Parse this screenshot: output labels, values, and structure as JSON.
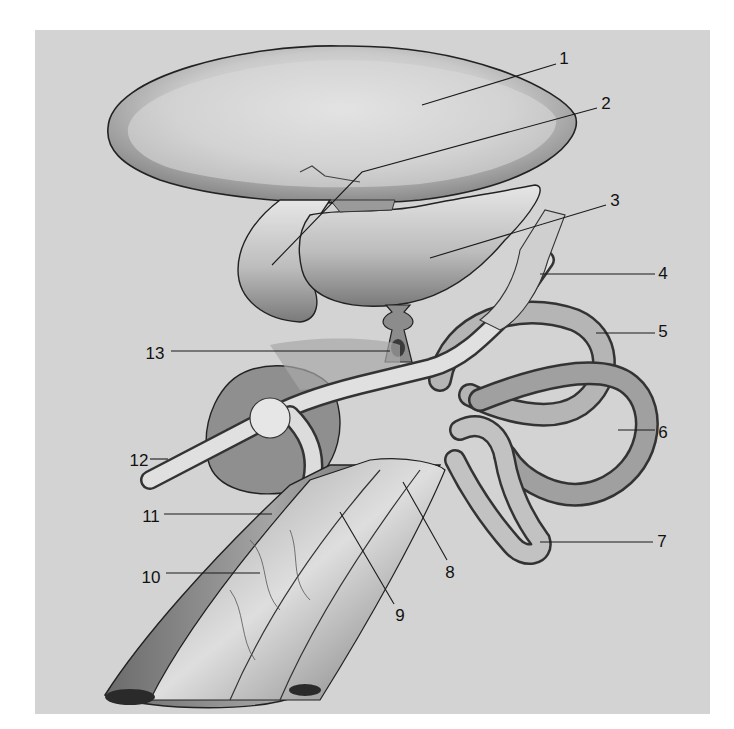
{
  "figure": {
    "background_color": "#d3d3d3",
    "line_color": "#1a1a1a",
    "labels": [
      {
        "id": 1,
        "text": "1",
        "x": 564,
        "y": 58,
        "leader": [
          [
            422,
            105
          ],
          [
            556,
            64
          ]
        ]
      },
      {
        "id": 2,
        "text": "2",
        "x": 606,
        "y": 103,
        "leader": [
          [
            272,
            265
          ],
          [
            362,
            172
          ],
          [
            597,
            108
          ]
        ]
      },
      {
        "id": 3,
        "text": "3",
        "x": 615,
        "y": 200,
        "leader": [
          [
            430,
            258
          ],
          [
            606,
            205
          ]
        ]
      },
      {
        "id": 4,
        "text": "4",
        "x": 663,
        "y": 273,
        "leader": [
          [
            540,
            274
          ],
          [
            655,
            274
          ]
        ]
      },
      {
        "id": 5,
        "text": "5",
        "x": 663,
        "y": 331,
        "leader": [
          [
            596,
            333
          ],
          [
            655,
            333
          ]
        ]
      },
      {
        "id": 6,
        "text": "6",
        "x": 663,
        "y": 432,
        "leader": [
          [
            618,
            430
          ],
          [
            655,
            430
          ]
        ]
      },
      {
        "id": 7,
        "text": "7",
        "x": 662,
        "y": 541,
        "leader": [
          [
            540,
            542
          ],
          [
            653,
            542
          ]
        ]
      },
      {
        "id": 8,
        "text": "8",
        "x": 450,
        "y": 572,
        "leader": [
          [
            403,
            482
          ],
          [
            447,
            560
          ]
        ]
      },
      {
        "id": 9,
        "text": "9",
        "x": 400,
        "y": 615,
        "leader": [
          [
            340,
            512
          ],
          [
            394,
            604
          ]
        ]
      },
      {
        "id": 10,
        "text": "10",
        "x": 151,
        "y": 577,
        "leader": [
          [
            166,
            573
          ],
          [
            260,
            573
          ]
        ]
      },
      {
        "id": 11,
        "text": "11",
        "x": 151,
        "y": 516,
        "leader": [
          [
            164,
            514
          ],
          [
            272,
            514
          ]
        ]
      },
      {
        "id": 12,
        "text": "12",
        "x": 139,
        "y": 460,
        "leader": [
          [
            150,
            459
          ],
          [
            168,
            459
          ]
        ]
      },
      {
        "id": 13,
        "text": "13",
        "x": 155,
        "y": 353,
        "leader": [
          [
            171,
            351
          ],
          [
            390,
            351
          ]
        ]
      }
    ]
  }
}
